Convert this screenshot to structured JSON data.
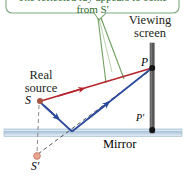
{
  "figure": {
    "title_note": "Reflection from a mirror onto a viewing screen",
    "callout": {
      "text": "The reflected ray appears to come from S'",
      "border_color": "#7fa87f",
      "pointer_color": "#6f9e5e"
    },
    "labels": {
      "viewing_screen_line1": "Viewing",
      "viewing_screen_line2": "screen",
      "real_source_line1": "Real",
      "real_source_line2": "source",
      "source_point": "S",
      "virtual_source_point": "S′",
      "screen_point": "P",
      "screen_base_point": "P′",
      "mirror": "Mirror"
    },
    "colors": {
      "direct_ray": "#b5272d",
      "reflected_ray": "#2b4a9b",
      "mirror_fill": "#b9cfe2",
      "mirror_edge": "#8fa9c0",
      "screen_bar": "#5a5a5a",
      "source_dot": "#a8533f",
      "virtual_source_dot": "#e8a090",
      "dashed_line": "#8a8a8a",
      "point_dot": "#1a1a1a",
      "callout_green": "#7fa87f",
      "text": "#231f20"
    },
    "geometry": {
      "source": [
        40,
        101
      ],
      "virtual_source": [
        37,
        157
      ],
      "screen_point_P": [
        152,
        68
      ],
      "screen_point_Pprime": [
        152,
        130
      ],
      "mirror_reflection_point": [
        72,
        132
      ],
      "screen_x": 152,
      "screen_top_y": 43,
      "screen_bottom_y": 133,
      "mirror_top_y": 129,
      "mirror_bottom_y": 136,
      "callout_tail": [
        99,
        12
      ]
    }
  }
}
